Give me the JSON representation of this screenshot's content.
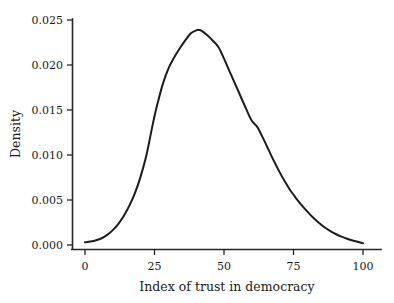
{
  "chart_data": {
    "type": "line",
    "title": "",
    "subtitle": "",
    "xlabel": "Index of trust in democracy",
    "ylabel": "Density",
    "xlim": [
      0,
      100
    ],
    "ylim": [
      0.0,
      0.025
    ],
    "xticks": [
      0,
      25,
      50,
      75,
      100
    ],
    "xtick_labels": [
      "0",
      "25",
      "50",
      "75",
      "100"
    ],
    "yticks": [
      0.0,
      0.005,
      0.01,
      0.015,
      0.02,
      0.025
    ],
    "ytick_labels": [
      "0.000",
      "0.005",
      "0.010",
      "0.015",
      "0.020",
      "0.025"
    ],
    "grid": false,
    "legend": null,
    "legend_position": "none",
    "annotations": [],
    "series": [
      {
        "name": "Density of index of trust in democracy",
        "color": "#1c1c1c",
        "line_width": 2.0,
        "x": [
          0,
          2,
          4,
          6,
          8,
          10,
          12,
          14,
          16,
          18,
          20,
          22,
          24,
          25,
          26,
          28,
          30,
          32,
          34,
          36,
          38,
          40,
          41,
          42,
          44,
          46,
          48,
          50,
          52,
          54,
          56,
          58,
          60,
          62,
          64,
          66,
          68,
          70,
          72,
          74,
          75,
          76,
          78,
          80,
          82,
          84,
          86,
          88,
          90,
          92,
          94,
          96,
          98,
          100
        ],
        "values": [
          0.0003,
          0.00038,
          0.00052,
          0.00075,
          0.00112,
          0.00165,
          0.00235,
          0.00325,
          0.0044,
          0.0058,
          0.0076,
          0.00985,
          0.01285,
          0.0143,
          0.0156,
          0.0179,
          0.0196,
          0.0208,
          0.0218,
          0.0227,
          0.0235,
          0.02385,
          0.0239,
          0.0238,
          0.0233,
          0.0227,
          0.022,
          0.0207,
          0.0193,
          0.0179,
          0.0165,
          0.0151,
          0.0138,
          0.0131,
          0.0119,
          0.0106,
          0.0093,
          0.0081,
          0.007,
          0.006,
          0.0056,
          0.00515,
          0.0044,
          0.0037,
          0.00305,
          0.0025,
          0.002,
          0.0016,
          0.00125,
          0.00095,
          0.00072,
          0.00052,
          0.00036,
          0.0002
        ]
      }
    ],
    "peak": {
      "x": 41,
      "y": 0.0239
    }
  },
  "axes": {
    "x_axis_name": "x-axis",
    "y_axis_name": "y-axis"
  }
}
